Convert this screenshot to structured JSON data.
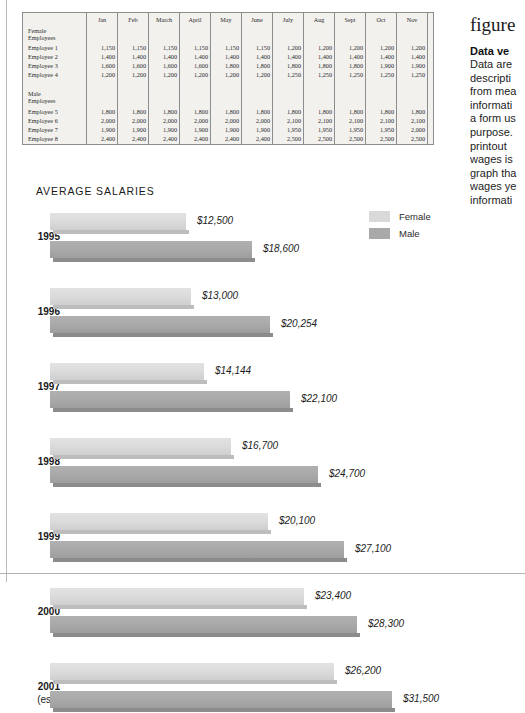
{
  "figure": {
    "caption_word": "figure",
    "heading": "Data ve",
    "body_lines": [
      "Data are",
      "descripti",
      "from mea",
      "informati",
      "a form us",
      "purpose.",
      "printout",
      "wages is",
      "graph tha",
      "wages ye",
      "informati"
    ]
  },
  "table": {
    "columns": [
      "Jan",
      "Feb",
      "March",
      "April",
      "May",
      "June",
      "July",
      "Aug",
      "Sept",
      "Oct",
      "Nov",
      "Dec",
      "Totals"
    ],
    "groups": [
      {
        "label_line1": "Female",
        "label_line2": "Employees",
        "rows": [
          {
            "name": "Employee 1",
            "values": [
              "1,150",
              "1,150",
              "1,150",
              "1,150",
              "1,150",
              "1,150",
              "1,200",
              "1,200",
              "1,200",
              "1,200",
              "1,200",
              "1,300"
            ],
            "total": "$14,200"
          },
          {
            "name": "Employee 2",
            "values": [
              "1,400",
              "1,400",
              "1,400",
              "1,400",
              "1,400",
              "1,400",
              "1,400",
              "1,400",
              "1,400",
              "1,400",
              "1,400",
              "1,400"
            ],
            "total": "$16,800"
          },
          {
            "name": "Employee 3",
            "values": [
              "1,600",
              "1,600",
              "1,600",
              "1,600",
              "1,800",
              "1,800",
              "1,800",
              "1,800",
              "1,800",
              "1,900",
              "1,900",
              "1,900"
            ],
            "total": "$21,100"
          },
          {
            "name": "Employee 4",
            "values": [
              "1,200",
              "1,200",
              "1,200",
              "1,200",
              "1,200",
              "1,200",
              "1,250",
              "1,250",
              "1,250",
              "1,250",
              "1,250",
              "1,250"
            ],
            "total": "$14,700"
          }
        ]
      },
      {
        "label_line1": "Male",
        "label_line2": "Employees",
        "rows": [
          {
            "name": "Employee 5",
            "values": [
              "1,800",
              "1,800",
              "1,800",
              "1,800",
              "1,800",
              "1,800",
              "1,800",
              "1,800",
              "1,800",
              "1,800",
              "1,800",
              "1,800"
            ],
            "total": "$21,600"
          },
          {
            "name": "Employee 6",
            "values": [
              "2,000",
              "2,000",
              "2,000",
              "2,000",
              "2,000",
              "2,000",
              "2,100",
              "2,100",
              "2,100",
              "2,100",
              "2,100",
              "2,100"
            ],
            "total": "$24,600"
          },
          {
            "name": "Employee 7",
            "values": [
              "1,900",
              "1,900",
              "1,900",
              "1,900",
              "1,900",
              "1,900",
              "1,950",
              "1,950",
              "1,950",
              "1,950",
              "2,000",
              "2,000"
            ],
            "total": "$23,200"
          },
          {
            "name": "Employee 8",
            "values": [
              "2,400",
              "2,400",
              "2,400",
              "2,400",
              "2,400",
              "2,400",
              "2,500",
              "2,500",
              "2,500",
              "2,500",
              "2,500",
              "2,500"
            ],
            "total": "$29,400"
          }
        ]
      }
    ]
  },
  "chart_data": {
    "type": "bar",
    "orientation": "horizontal",
    "title": "AVERAGE SALARIES",
    "xlabel": "",
    "ylabel": "",
    "grid": false,
    "legend_position": "top-right",
    "categories": [
      "1995",
      "1996",
      "1997",
      "1998",
      "1999",
      "2000",
      "2001 (est.)"
    ],
    "category_labels": [
      {
        "line1": "1995",
        "line2": ""
      },
      {
        "line1": "1996",
        "line2": ""
      },
      {
        "line1": "1997",
        "line2": ""
      },
      {
        "line1": "1998",
        "line2": ""
      },
      {
        "line1": "1999",
        "line2": ""
      },
      {
        "line1": "2000",
        "line2": ""
      },
      {
        "line1": "2001",
        "line2": "(est.)"
      }
    ],
    "series": [
      {
        "name": "Female",
        "color": "#d9d9d9",
        "values": [
          12500,
          13000,
          14144,
          16700,
          20100,
          23400,
          26200
        ],
        "labels": [
          "$12,500",
          "$13,000",
          "$14,144",
          "$16,700",
          "$20,100",
          "$23,400",
          "$26,200"
        ]
      },
      {
        "name": "Male",
        "color": "#a9a9a9",
        "values": [
          18600,
          20254,
          22100,
          24700,
          27100,
          28300,
          31500
        ],
        "labels": [
          "$18,600",
          "$20,254",
          "$22,100",
          "$24,700",
          "$27,100",
          "$28,300",
          "$31,500"
        ]
      }
    ],
    "xlim": [
      0,
      31500
    ]
  },
  "colors": {
    "female": "#d9d9d9",
    "male": "#a9a9a9",
    "table_bg": "#f2f1ee",
    "rule": "#b9b9b9"
  }
}
